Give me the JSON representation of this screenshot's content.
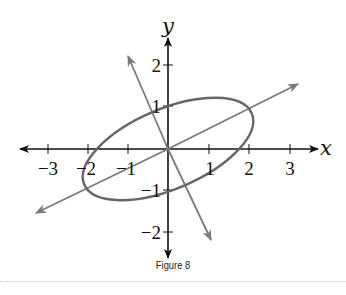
{
  "figure": {
    "caption": "Figure 8",
    "x_axis_label": "x",
    "y_axis_label": "y",
    "x_ticks": [
      {
        "value": -3,
        "label": "−3"
      },
      {
        "value": -2,
        "label": "−2"
      },
      {
        "value": -1,
        "label": "−1"
      },
      {
        "value": 1,
        "label": "1"
      },
      {
        "value": 2,
        "label": "2"
      },
      {
        "value": 3,
        "label": "3"
      }
    ],
    "y_ticks": [
      {
        "value": 2,
        "label": "2"
      },
      {
        "value": 1,
        "label": "1"
      },
      {
        "value": -1,
        "label": "−1"
      },
      {
        "value": -2,
        "label": "−2"
      }
    ],
    "colors": {
      "axes": "#111111",
      "rotated_axes": "#7a7a7a",
      "ellipse": "#666666"
    },
    "elements": {
      "ellipse": "Rotated ellipse centered at origin, major axis along slope 1/2",
      "rotated_axis_1": "Line through origin with slope 1/2 (arrows both ends)",
      "rotated_axis_2": "Line through origin with slope -2 (arrows both ends)"
    }
  }
}
